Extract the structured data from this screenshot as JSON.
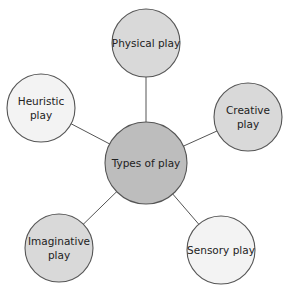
{
  "diagram": {
    "type": "mind-map",
    "center": {
      "label": "Types of play",
      "cx": 146,
      "cy": 163,
      "r": 41,
      "fill": "#bdbdbd"
    },
    "nodes": [
      {
        "id": "physical",
        "lines": [
          "Physical play"
        ],
        "cx": 146,
        "cy": 43,
        "r": 34,
        "fill": "#d9d9d9"
      },
      {
        "id": "creative",
        "lines": [
          "Creative",
          "play"
        ],
        "cx": 248,
        "cy": 117,
        "r": 34,
        "fill": "#d9d9d9"
      },
      {
        "id": "sensory",
        "lines": [
          "Sensory play"
        ],
        "cx": 221,
        "cy": 250,
        "r": 34,
        "fill": "#f3f3f3"
      },
      {
        "id": "imaginative",
        "lines": [
          "Imaginative",
          "play"
        ],
        "cx": 59,
        "cy": 248,
        "r": 34,
        "fill": "#d9d9d9"
      },
      {
        "id": "heuristic",
        "lines": [
          "Heuristic",
          "play"
        ],
        "cx": 41,
        "cy": 108,
        "r": 34,
        "fill": "#f3f3f3"
      }
    ],
    "stroke": "#555555"
  }
}
